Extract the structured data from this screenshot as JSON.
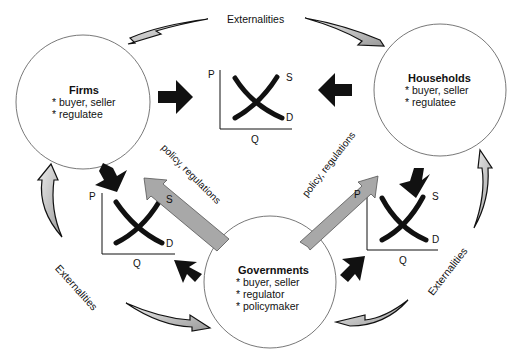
{
  "diagram": {
    "top_label": "Externalities",
    "left_label": "Externalities",
    "right_label": "Externalities",
    "policy_left": "policy, regulations",
    "policy_right": "policy, regulations",
    "firms": {
      "title": "Firms",
      "items": [
        "* buyer, seller",
        "* regulatee"
      ]
    },
    "households": {
      "title": "Households",
      "items": [
        "* buyer, seller",
        "* regulatee"
      ]
    },
    "governments": {
      "title": "Governments",
      "items": [
        "* buyer, seller",
        "* regulator",
        "* policymaker"
      ]
    },
    "markets": [
      {
        "id": "top",
        "p": "P",
        "q": "Q",
        "s": "S",
        "d": "D"
      },
      {
        "id": "left",
        "p": "P",
        "q": "Q",
        "s": "S",
        "d": "D"
      },
      {
        "id": "right",
        "p": "P",
        "q": "Q",
        "s": "S",
        "d": "D"
      }
    ],
    "colors": {
      "arrow_black": "#111111",
      "arrow_gray": "#a8a8a8",
      "circle_stroke": "#555555"
    }
  }
}
